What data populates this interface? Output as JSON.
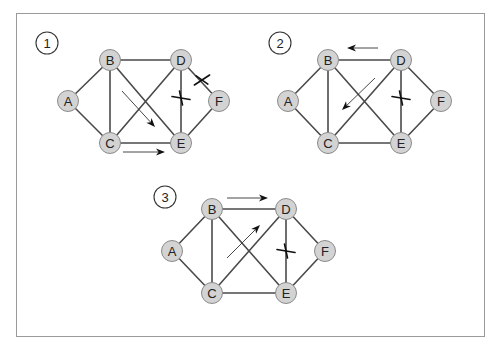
{
  "frame": {
    "x": 16,
    "y": 13,
    "width": 468,
    "height": 323
  },
  "colors": {
    "edge": "#4a4a4a",
    "node_fill": "#d3d3d3",
    "node_stroke": "#8a8a8a",
    "frame": "#9a9a9a",
    "arrow": "#333333",
    "cross": "#111111"
  },
  "edges": [
    [
      "A",
      "B"
    ],
    [
      "A",
      "C"
    ],
    [
      "B",
      "C"
    ],
    [
      "B",
      "D"
    ],
    [
      "B",
      "E"
    ],
    [
      "C",
      "D"
    ],
    [
      "C",
      "E"
    ],
    [
      "D",
      "E"
    ],
    [
      "D",
      "F"
    ],
    [
      "E",
      "F"
    ]
  ],
  "diagrams": [
    {
      "step": "1",
      "label_pos": [
        47,
        43
      ],
      "nodes": {
        "A": [
          68,
          101
        ],
        "B": [
          110,
          60
        ],
        "C": [
          110,
          143
        ],
        "D": [
          181,
          60
        ],
        "E": [
          181,
          143
        ],
        "F": [
          219,
          101
        ]
      },
      "arrows": [
        {
          "from": [
            122,
            91
          ],
          "to": [
            155,
            127
          ]
        },
        {
          "from": [
            123,
            152
          ],
          "to": [
            165,
            152
          ]
        }
      ],
      "crosses": [
        {
          "edge": [
            "D",
            "E"
          ],
          "at": [
            181,
            98
          ]
        },
        {
          "edge": [
            "D",
            "F"
          ],
          "at": [
            202,
            80
          ]
        }
      ]
    },
    {
      "step": "2",
      "label_pos": [
        280,
        43
      ],
      "nodes": {
        "A": [
          288,
          101
        ],
        "B": [
          328,
          60
        ],
        "C": [
          328,
          143
        ],
        "D": [
          401,
          60
        ],
        "E": [
          401,
          143
        ],
        "F": [
          441,
          101
        ]
      },
      "arrows": [
        {
          "from": [
            378,
            48
          ],
          "to": [
            347,
            48
          ]
        },
        {
          "from": [
            375,
            78
          ],
          "to": [
            342,
            110
          ]
        }
      ],
      "crosses": [
        {
          "edge": [
            "D",
            "E"
          ],
          "at": [
            401,
            98
          ]
        }
      ]
    },
    {
      "step": "3",
      "label_pos": [
        165,
        197
      ],
      "nodes": {
        "A": [
          172,
          251
        ],
        "B": [
          212,
          209
        ],
        "C": [
          212,
          293
        ],
        "D": [
          286,
          209
        ],
        "E": [
          286,
          293
        ],
        "F": [
          325,
          251
        ]
      },
      "arrows": [
        {
          "from": [
            227,
            198
          ],
          "to": [
            268,
            198
          ]
        },
        {
          "from": [
            227,
            258
          ],
          "to": [
            260,
            225
          ]
        }
      ],
      "crosses": [
        {
          "edge": [
            "D",
            "E"
          ],
          "at": [
            286,
            251
          ]
        }
      ]
    }
  ]
}
